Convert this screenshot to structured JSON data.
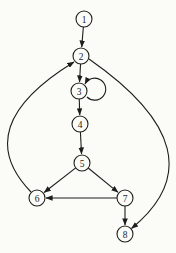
{
  "diagram": {
    "type": "directed-graph",
    "background": "#fbfbf8",
    "stroke": "#1d1d1b",
    "node_fill": "#fbfbf8",
    "node_radius": 8,
    "nodes": [
      {
        "id": "1",
        "label": "1",
        "x": 84,
        "y": 19
      },
      {
        "id": "2",
        "label": "2",
        "x": 81,
        "y": 56
      },
      {
        "id": "3",
        "label": "3",
        "x": 79,
        "y": 91
      },
      {
        "id": "4",
        "label": "4",
        "x": 80,
        "y": 124
      },
      {
        "id": "5",
        "label": "5",
        "x": 82,
        "y": 163
      },
      {
        "id": "6",
        "label": "6",
        "x": 37,
        "y": 198
      },
      {
        "id": "7",
        "label": "7",
        "x": 125,
        "y": 198
      },
      {
        "id": "8",
        "label": "8",
        "x": 125,
        "y": 234
      }
    ],
    "edges": [
      {
        "from": "1",
        "to": "2",
        "type": "straight"
      },
      {
        "from": "2",
        "to": "3",
        "type": "straight"
      },
      {
        "from": "3",
        "to": "3",
        "type": "self-loop",
        "d": "M 87 97 A 11 11 0 1 0 85 84"
      },
      {
        "from": "3",
        "to": "4",
        "type": "straight"
      },
      {
        "from": "4",
        "to": "5",
        "type": "straight"
      },
      {
        "from": "5",
        "to": "6",
        "type": "straight"
      },
      {
        "from": "5",
        "to": "7",
        "type": "straight"
      },
      {
        "from": "7",
        "to": "6",
        "type": "straight"
      },
      {
        "from": "7",
        "to": "8",
        "type": "straight"
      },
      {
        "from": "6",
        "to": "2",
        "type": "curve",
        "d": "M 31 192 Q -32 127 74 62"
      },
      {
        "from": "2",
        "to": "8",
        "type": "curve",
        "d": "M 89 59 Q 224 153 131.5 228.5"
      }
    ]
  }
}
